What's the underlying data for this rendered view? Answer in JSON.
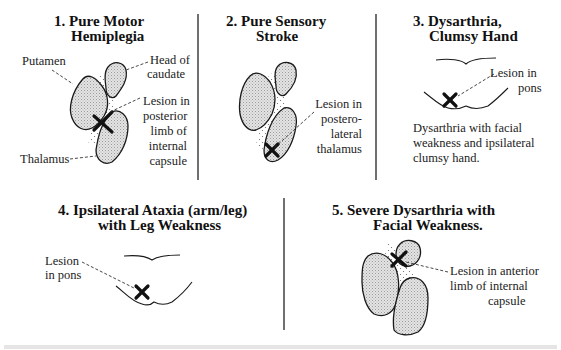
{
  "colors": {
    "ink": "#1a1a1a",
    "fill": "#d9d9d9",
    "divider": "#333333",
    "background": "#ffffff"
  },
  "panels": [
    {
      "number": "1.",
      "title_line1": "1. Pure Motor",
      "title_line2": "Hemiplegia",
      "labels": {
        "putamen": "Putamen",
        "head_of_caudate_1": "Head of",
        "head_of_caudate_2": "caudate",
        "lesion_1": "Lesion in",
        "lesion_2": "posterior",
        "lesion_3": "limb of",
        "lesion_4": "internal",
        "lesion_5": "capsule",
        "thalamus": "Thalamus"
      },
      "lesion_marker": "x-mark"
    },
    {
      "number": "2.",
      "title_line1": "2. Pure Sensory",
      "title_line2": "Stroke",
      "labels": {
        "lesion_1": "Lesion in",
        "lesion_2": "postero-",
        "lesion_3": "lateral",
        "lesion_4": "thalamus"
      },
      "lesion_marker": "x-mark"
    },
    {
      "number": "3.",
      "title_line1": "3. Dysarthria,",
      "title_line2": "Clumsy Hand",
      "labels": {
        "lesion_1": "Lesion in",
        "lesion_2": "pons"
      },
      "description_1": "Dysarthria with facial",
      "description_2": "weakness and ipsilateral",
      "description_3": "clumsy hand.",
      "lesion_marker": "x-mark"
    },
    {
      "number": "4.",
      "title_line1": "4. Ipsilateral Ataxia (arm/leg)",
      "title_line2": "with Leg Weakness",
      "labels": {
        "lesion_1": "Lesion",
        "lesion_2": "in pons"
      },
      "lesion_marker": "x-mark"
    },
    {
      "number": "5.",
      "title_line1": "5. Severe Dysarthria with",
      "title_line2": "Facial Weakness.",
      "labels": {
        "lesion_1": "Lesion in anterior",
        "lesion_2": "limb of internal",
        "lesion_3": "capsule"
      },
      "lesion_marker": "x-mark"
    }
  ]
}
